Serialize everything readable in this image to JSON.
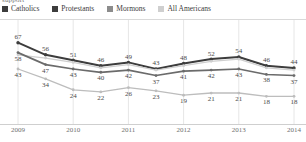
{
  "clipped_title": "support",
  "legend": {
    "items": [
      {
        "label": "Catholics",
        "color": "#3d3d3d"
      },
      {
        "label": "Protestants",
        "color": "#3d3d3d"
      },
      {
        "label": "Mormons",
        "color": "#8c8c8c"
      },
      {
        "label": "All Americans",
        "color": "#cfcfcf"
      }
    ]
  },
  "axis": {
    "years": [
      "2009",
      "2010",
      "2011",
      "2012",
      "2013",
      "2014"
    ]
  },
  "chart_data": {
    "type": "line",
    "title": "support",
    "xlabel": "",
    "ylabel": "",
    "ylim": [
      0,
      75
    ],
    "grid": false,
    "legend_position": "top-left",
    "x": [
      2009,
      2009.5,
      2010,
      2010.5,
      2011,
      2011.5,
      2012,
      2012.5,
      2013,
      2013.5,
      2014
    ],
    "tick_labels": [
      "2009",
      "2010",
      "2011",
      "2012",
      "2013",
      "2014"
    ],
    "series": [
      {
        "name": "Catholics",
        "color": "#3d3d3d",
        "values": [
          67,
          56,
          51,
          46,
          49,
          43,
          48,
          52,
          54,
          46,
          44
        ],
        "labels": [
          "67",
          "56",
          "51",
          "46",
          "49",
          "43",
          "48",
          "52",
          "54",
          "46",
          "44"
        ]
      },
      {
        "name": "All Americans",
        "color": "#cfcfcf",
        "values": [
          56,
          53,
          49,
          44,
          47,
          42,
          46,
          50,
          52,
          44,
          42
        ],
        "labels": [
          "",
          "",
          "",
          "",
          "",
          "",
          "",
          "",
          "",
          "",
          ""
        ]
      },
      {
        "name": "Protestants",
        "color": "#6b6b6b",
        "values": [
          58,
          47,
          43,
          40,
          42,
          37,
          41,
          42,
          43,
          38,
          37
        ],
        "labels": [
          "58",
          "47",
          "43",
          "40",
          "42",
          "37",
          "41",
          "42",
          "43",
          "38",
          "37"
        ]
      },
      {
        "name": "Mormons",
        "color": "#bdbdbd",
        "values": [
          43,
          34,
          24,
          22,
          26,
          23,
          19,
          21,
          21,
          18,
          18
        ],
        "labels": [
          "43",
          "34",
          "24",
          "22",
          "26",
          "23",
          "19",
          "21",
          "21",
          "18",
          "18"
        ]
      }
    ]
  }
}
